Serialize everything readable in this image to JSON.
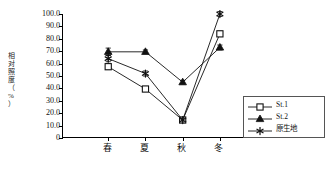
{
  "chart_data": {
    "type": "line",
    "title": "",
    "xlabel": "",
    "ylabel": "相对照度（%）",
    "categories": [
      "春",
      "夏",
      "秋",
      "冬"
    ],
    "ylim": [
      0,
      100
    ],
    "ytick_labels": [
      "100.0",
      "90.0",
      "80.0",
      "70.0",
      "60.0",
      "50.0",
      "40.0",
      "30.0",
      "20.0",
      "10.0",
      "0"
    ],
    "ytick_values": [
      100,
      90,
      80,
      70,
      60,
      50,
      40,
      30,
      20,
      10,
      0
    ],
    "grid": false,
    "legend_position": "bottom-right",
    "series": [
      {
        "name": "St.1",
        "marker": "open-circle",
        "values": [
          57.5,
          39.5,
          14.5,
          84.0
        ],
        "errors": [
          2.0,
          1.5,
          1.5,
          2.0
        ]
      },
      {
        "name": "St.2",
        "marker": "filled-triangle",
        "values": [
          69.5,
          69.5,
          45.0,
          73.0
        ],
        "errors": [
          3.0,
          1.5,
          1.5,
          2.0
        ]
      },
      {
        "name": "原生地",
        "marker": "asterisk",
        "values": [
          64.0,
          52.0,
          14.5,
          100.0
        ],
        "errors": [
          2.5,
          2.0,
          1.5,
          2.0
        ]
      }
    ]
  },
  "legend": {
    "items": [
      {
        "label": "St.1",
        "marker": "open-circle"
      },
      {
        "label": "St.2",
        "marker": "filled-triangle"
      },
      {
        "label": "原生地",
        "marker": "asterisk"
      }
    ]
  },
  "axis": {
    "y_title": "相对照度（%）"
  }
}
